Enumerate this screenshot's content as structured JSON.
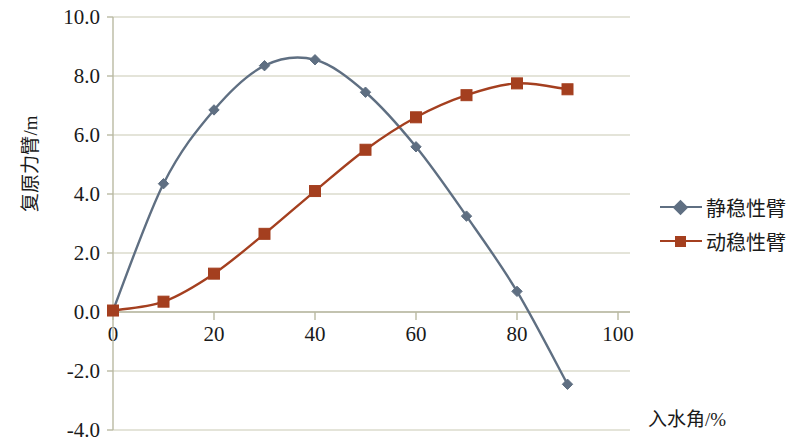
{
  "chart_data": {
    "type": "line",
    "title": "",
    "xlabel": "入水角/%",
    "ylabel": "复原力臂/m",
    "xlim": [
      0,
      100
    ],
    "ylim": [
      -4.0,
      10.0
    ],
    "xticks": [
      "0",
      "20",
      "40",
      "60",
      "80",
      "100"
    ],
    "xtick_values": [
      0,
      20,
      40,
      60,
      80,
      100
    ],
    "yticks": [
      "10.0",
      "8.0",
      "6.0",
      "4.0",
      "2.0",
      "0.0",
      "-2.0",
      "-4.0"
    ],
    "ytick_values": [
      10.0,
      8.0,
      6.0,
      4.0,
      2.0,
      0.0,
      -2.0,
      -4.0
    ],
    "grid": "horizontal",
    "legend_position": "right",
    "x": [
      0,
      10,
      20,
      30,
      40,
      50,
      60,
      70,
      80,
      90
    ],
    "series": [
      {
        "name": "静稳性臂",
        "color": "#5f6f82",
        "marker": "diamond",
        "values": [
          0.05,
          4.35,
          6.85,
          8.35,
          8.55,
          7.45,
          5.6,
          3.25,
          0.7,
          -2.45
        ]
      },
      {
        "name": "动稳性臂",
        "color": "#a43f1f",
        "marker": "square",
        "values": [
          0.05,
          0.35,
          1.3,
          2.65,
          4.1,
          5.5,
          6.6,
          7.35,
          7.75,
          7.55
        ]
      }
    ]
  },
  "colors": {
    "grid": "#c9c9b4",
    "axis": "#b9b9a2",
    "text": "#1a1a1a",
    "series_static": "#5f6f82",
    "series_dynamic": "#a43f1f",
    "background": "#ffffff"
  },
  "legend": {
    "items": [
      {
        "label": "静稳性臂",
        "color": "#5f6f82",
        "marker": "diamond-icon"
      },
      {
        "label": "动稳性臂",
        "color": "#a43f1f",
        "marker": "square-icon"
      }
    ]
  }
}
